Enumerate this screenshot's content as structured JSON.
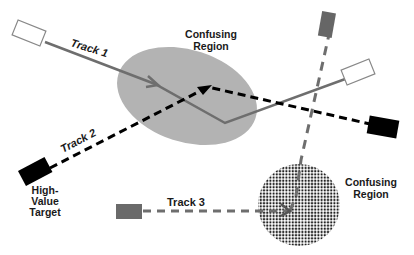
{
  "diagram": {
    "regions": [
      {
        "id": "region-1",
        "label_line1": "Confusing",
        "label_line2": "Region",
        "fill": "#b3b3b3",
        "style": "solid"
      },
      {
        "id": "region-2",
        "label_line1": "Confusing",
        "label_line2": "Region",
        "fill": "#222222",
        "style": "dotted"
      }
    ],
    "tracks": [
      {
        "id": "track-1",
        "label": "Track 1",
        "color": "#6e6e6e",
        "style": "solid",
        "start_marker": "white-box",
        "end_marker": "white-box"
      },
      {
        "id": "track-2",
        "label": "Track 2",
        "color": "#000000",
        "style": "dashed",
        "start_marker": "black-box",
        "end_marker": "black-box"
      },
      {
        "id": "track-3",
        "label": "Track 3",
        "color": "#6e6e6e",
        "style": "dashed",
        "start_marker": "gray-box",
        "end_marker": "gray-box"
      }
    ],
    "target": {
      "line1": "High-",
      "line2": "Value",
      "line3": "Target"
    }
  }
}
